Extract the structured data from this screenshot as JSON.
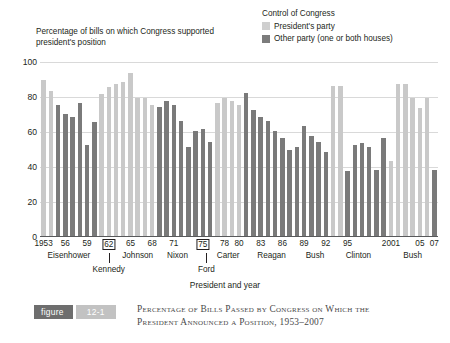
{
  "legend": {
    "title": "Control of Congress",
    "items": [
      {
        "label": "President's party",
        "color": "#cfcfcf",
        "swatch_name": "presidents-party-swatch"
      },
      {
        "label": "Other party (one or both houses)",
        "color": "#7c7c7c",
        "swatch_name": "other-party-swatch"
      }
    ]
  },
  "axis": {
    "ytitle": "Percentage of bills on which Congress supported president's position",
    "xtitle": "President and year",
    "yticks": [
      "100",
      "80",
      "60",
      "40",
      "20",
      "0"
    ],
    "ylim": [
      0,
      100
    ]
  },
  "caption": {
    "figure_word": "figure",
    "figure_number": "12-1",
    "line1": "Percentage of Bills Passed by Congress on Which the",
    "line2": "President Announced a Position, 1953–2007"
  },
  "chart_data": {
    "type": "bar",
    "title": "Percentage of Bills Passed by Congress on Which the President Announced a Position, 1953–2007",
    "xlabel": "President and year",
    "ylabel": "Percentage of bills on which Congress supported president's position",
    "ylim": [
      0,
      100
    ],
    "grid": true,
    "legend_position": "top-right",
    "series_names": [
      "President's party",
      "Other party (one or both houses)"
    ],
    "xtick_labels": [
      "1953",
      "56",
      "59",
      "62",
      "65",
      "68",
      "71",
      "75",
      "78",
      "80",
      "83",
      "86",
      "89",
      "92",
      "95",
      "2001",
      "05",
      "07"
    ],
    "xtick_years": [
      1953,
      1956,
      1959,
      1962,
      1965,
      1968,
      1971,
      1975,
      1978,
      1980,
      1983,
      1986,
      1989,
      1992,
      1995,
      2001,
      2005,
      2007
    ],
    "xtick_boxed": [
      1962,
      1975
    ],
    "presidents": [
      {
        "name": "Eisenhower",
        "start": 1953,
        "end": 1960,
        "row": 1
      },
      {
        "name": "Kennedy",
        "start": 1961,
        "end": 1963,
        "row": 2
      },
      {
        "name": "Johnson",
        "start": 1964,
        "end": 1968,
        "row": 1
      },
      {
        "name": "Nixon",
        "start": 1969,
        "end": 1974,
        "row": 1
      },
      {
        "name": "Ford",
        "start": 1975,
        "end": 1976,
        "row": 2
      },
      {
        "name": "Carter",
        "start": 1977,
        "end": 1980,
        "row": 1
      },
      {
        "name": "Reagan",
        "start": 1981,
        "end": 1988,
        "row": 1
      },
      {
        "name": "Bush",
        "start": 1989,
        "end": 1992,
        "row": 1
      },
      {
        "name": "Clinton",
        "start": 1993,
        "end": 2000,
        "row": 1
      },
      {
        "name": "Bush",
        "start": 2001,
        "end": 2007,
        "row": 1
      }
    ],
    "points": [
      {
        "year": 1953,
        "value": 89,
        "party": "president"
      },
      {
        "year": 1954,
        "value": 83,
        "party": "president"
      },
      {
        "year": 1955,
        "value": 75,
        "party": "other"
      },
      {
        "year": 1956,
        "value": 70,
        "party": "other"
      },
      {
        "year": 1957,
        "value": 68,
        "party": "other"
      },
      {
        "year": 1958,
        "value": 76,
        "party": "other"
      },
      {
        "year": 1959,
        "value": 52,
        "party": "other"
      },
      {
        "year": 1960,
        "value": 65,
        "party": "other"
      },
      {
        "year": 1961,
        "value": 81,
        "party": "president"
      },
      {
        "year": 1962,
        "value": 85,
        "party": "president"
      },
      {
        "year": 1963,
        "value": 87,
        "party": "president"
      },
      {
        "year": 1964,
        "value": 88,
        "party": "president"
      },
      {
        "year": 1965,
        "value": 93,
        "party": "president"
      },
      {
        "year": 1966,
        "value": 79,
        "party": "president"
      },
      {
        "year": 1967,
        "value": 79,
        "party": "president"
      },
      {
        "year": 1968,
        "value": 75,
        "party": "president"
      },
      {
        "year": 1969,
        "value": 74,
        "party": "other"
      },
      {
        "year": 1970,
        "value": 77,
        "party": "other"
      },
      {
        "year": 1971,
        "value": 75,
        "party": "other"
      },
      {
        "year": 1972,
        "value": 66,
        "party": "other"
      },
      {
        "year": 1973,
        "value": 51,
        "party": "other"
      },
      {
        "year": 1974,
        "value": 60,
        "party": "other"
      },
      {
        "year": 1975,
        "value": 61,
        "party": "other"
      },
      {
        "year": 1976,
        "value": 54,
        "party": "other"
      },
      {
        "year": 1977,
        "value": 76,
        "party": "president"
      },
      {
        "year": 1978,
        "value": 79,
        "party": "president"
      },
      {
        "year": 1979,
        "value": 77,
        "party": "president"
      },
      {
        "year": 1980,
        "value": 75,
        "party": "president"
      },
      {
        "year": 1981,
        "value": 82,
        "party": "other"
      },
      {
        "year": 1982,
        "value": 72,
        "party": "other"
      },
      {
        "year": 1983,
        "value": 68,
        "party": "other"
      },
      {
        "year": 1984,
        "value": 66,
        "party": "other"
      },
      {
        "year": 1985,
        "value": 60,
        "party": "other"
      },
      {
        "year": 1986,
        "value": 56,
        "party": "other"
      },
      {
        "year": 1987,
        "value": 49,
        "party": "other"
      },
      {
        "year": 1988,
        "value": 51,
        "party": "other"
      },
      {
        "year": 1989,
        "value": 63,
        "party": "other"
      },
      {
        "year": 1990,
        "value": 57,
        "party": "other"
      },
      {
        "year": 1991,
        "value": 54,
        "party": "other"
      },
      {
        "year": 1992,
        "value": 48,
        "party": "other"
      },
      {
        "year": 1993,
        "value": 86,
        "party": "president"
      },
      {
        "year": 1994,
        "value": 86,
        "party": "president"
      },
      {
        "year": 1995,
        "value": 37,
        "party": "other"
      },
      {
        "year": 1996,
        "value": 52,
        "party": "other"
      },
      {
        "year": 1997,
        "value": 53,
        "party": "other"
      },
      {
        "year": 1998,
        "value": 51,
        "party": "other"
      },
      {
        "year": 1999,
        "value": 38,
        "party": "other"
      },
      {
        "year": 2000,
        "value": 56,
        "party": "other"
      },
      {
        "year": 2001,
        "value": 43,
        "party": "president"
      },
      {
        "year": 2002,
        "value": 87,
        "party": "president"
      },
      {
        "year": 2003,
        "value": 87,
        "party": "president"
      },
      {
        "year": 2004,
        "value": 79,
        "party": "president"
      },
      {
        "year": 2005,
        "value": 73,
        "party": "president"
      },
      {
        "year": 2006,
        "value": 79,
        "party": "president"
      },
      {
        "year": 2007,
        "value": 38,
        "party": "other"
      }
    ]
  }
}
